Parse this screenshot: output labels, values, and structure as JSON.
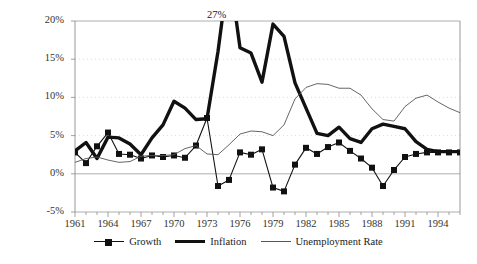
{
  "chart_data": {
    "type": "line",
    "title": "",
    "xlabel": "",
    "ylabel": "",
    "xlim": [
      1961,
      1996
    ],
    "ylim": [
      -5,
      20
    ],
    "ytick_labels": [
      "20%",
      "15%",
      "10%",
      "5%",
      "0%",
      "-5%"
    ],
    "ytick_values": [
      20,
      15,
      10,
      5,
      0,
      -5
    ],
    "xtick_labels": [
      "1961",
      "1964",
      "1967",
      "1970",
      "1973",
      "1976",
      "1979",
      "1982",
      "1985",
      "1988",
      "1991",
      "1994"
    ],
    "xtick_values": [
      1961,
      1964,
      1967,
      1970,
      1973,
      1976,
      1979,
      1982,
      1985,
      1988,
      1991,
      1994
    ],
    "grid": true,
    "legend_position": "bottom",
    "annotations": [
      {
        "text": "27%",
        "x": 1975,
        "y": 20.6,
        "note": "inflation peak value clipped by axis"
      }
    ],
    "x": [
      1961,
      1962,
      1963,
      1964,
      1965,
      1966,
      1967,
      1968,
      1969,
      1970,
      1971,
      1972,
      1973,
      1974,
      1975,
      1976,
      1977,
      1978,
      1979,
      1980,
      1981,
      1982,
      1983,
      1984,
      1985,
      1986,
      1987,
      1988,
      1989,
      1990,
      1991,
      1992,
      1993,
      1994,
      1995,
      1996
    ],
    "series": [
      {
        "name": "Growth",
        "style": "thin-marker",
        "color": "#111111",
        "marker": "square",
        "values": [
          2.8,
          1.4,
          3.6,
          5.4,
          2.6,
          2.5,
          2.0,
          2.4,
          2.2,
          2.4,
          2.1,
          3.7,
          7.3,
          -1.6,
          -0.8,
          2.8,
          2.5,
          3.2,
          -1.8,
          -2.3,
          1.2,
          3.4,
          2.6,
          3.5,
          4.1,
          3.0,
          2.0,
          0.8,
          -1.6,
          0.5,
          2.2,
          2.6,
          2.8,
          2.8,
          2.8,
          2.8
        ]
      },
      {
        "name": "Inflation",
        "style": "thick",
        "color": "#111111",
        "values": [
          3.0,
          4.1,
          2.0,
          4.8,
          4.7,
          3.9,
          2.5,
          4.7,
          6.4,
          9.5,
          8.6,
          7.1,
          7.2,
          16.0,
          27.0,
          16.5,
          15.8,
          12.0,
          19.6,
          18.0,
          11.9,
          8.6,
          5.3,
          5.0,
          6.1,
          4.6,
          4.1,
          5.9,
          6.5,
          6.2,
          5.9,
          4.2,
          3.2,
          2.9,
          2.9,
          2.9
        ]
      },
      {
        "name": "Unemployment Rate",
        "style": "thin",
        "color": "#555555",
        "values": [
          1.5,
          2.0,
          2.2,
          1.8,
          1.5,
          1.6,
          2.3,
          2.4,
          2.4,
          2.5,
          3.3,
          3.7,
          2.6,
          2.5,
          3.8,
          5.2,
          5.6,
          5.5,
          5.0,
          6.4,
          9.8,
          11.3,
          11.8,
          11.7,
          11.2,
          11.2,
          10.3,
          8.5,
          7.1,
          6.9,
          8.8,
          9.9,
          10.3,
          9.4,
          8.6,
          8.0
        ]
      }
    ]
  },
  "legend": {
    "items": [
      {
        "label": "Growth",
        "key": "growth"
      },
      {
        "label": "Inflation",
        "key": "inflation"
      },
      {
        "label": "Unemployment Rate",
        "key": "unemployment"
      }
    ]
  }
}
